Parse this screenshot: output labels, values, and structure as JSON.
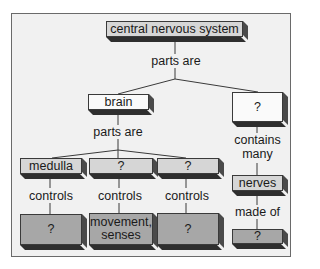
{
  "diagram": {
    "type": "concept-map",
    "root": {
      "label": "central nervous system"
    },
    "root_link": "parts are",
    "brain": {
      "label": "brain"
    },
    "brain_link": "parts are",
    "right_part": {
      "label": "?"
    },
    "brain_parts": [
      {
        "label": "medulla",
        "link": "controls",
        "controls": "?"
      },
      {
        "label": "?",
        "link": "controls",
        "controls_line1": "movement,",
        "controls_line2": "senses"
      },
      {
        "label": "?",
        "link": "controls",
        "controls": "?"
      }
    ],
    "right_chain": {
      "link1_line1": "contains",
      "link1_line2": "many",
      "nerves": "nerves",
      "link2": "made of",
      "end": "?"
    }
  },
  "colors": {
    "frame_bg": "#f1f1f1",
    "frame_border": "#6a6a6a",
    "box_white": "#fafafa",
    "box_light": "#d6d6d6",
    "box_dark": "#a7a7a7",
    "box_shadow": "#3a3a3a"
  }
}
